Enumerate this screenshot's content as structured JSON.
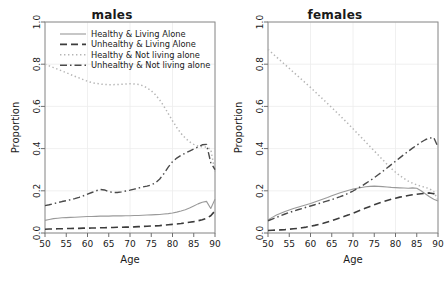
{
  "figure": {
    "background": "#ffffff",
    "axis_label_x": "Age",
    "axis_label_y": "Proportion"
  },
  "legend": {
    "items": [
      {
        "label": "Healthy & Living Alone",
        "style": "solid",
        "color": "#9a9a9a"
      },
      {
        "label": "Unhealthy & Living Alone",
        "style": "dashed",
        "color": "#3c3c3c"
      },
      {
        "label": "Healthy & Not living alone",
        "style": "dotted",
        "color": "#b5b5b5"
      },
      {
        "label": "Unhealthy & Not living alone",
        "style": "dashdot",
        "color": "#4a4a4a"
      }
    ]
  },
  "chart_data": [
    {
      "type": "line",
      "title": "males",
      "xlabel": "Age",
      "ylabel": "Proportion",
      "xlim": [
        50,
        90
      ],
      "ylim": [
        0.0,
        1.0
      ],
      "xticks": [
        50,
        55,
        60,
        65,
        70,
        75,
        80,
        85,
        90
      ],
      "yticks": [
        0.0,
        0.2,
        0.4,
        0.6,
        0.8,
        1.0
      ],
      "grid": true,
      "legend_position": "top-left-inside",
      "x": [
        50,
        51,
        52,
        53,
        54,
        55,
        56,
        57,
        58,
        59,
        60,
        61,
        62,
        63,
        64,
        65,
        66,
        67,
        68,
        69,
        70,
        71,
        72,
        73,
        74,
        75,
        76,
        77,
        78,
        79,
        80,
        81,
        82,
        83,
        84,
        85,
        86,
        87,
        88,
        89,
        90
      ],
      "series": [
        {
          "name": "Healthy & Living Alone",
          "style": "solid",
          "color": "#9a9a9a",
          "values": [
            0.06,
            0.064,
            0.068,
            0.07,
            0.072,
            0.073,
            0.074,
            0.075,
            0.076,
            0.077,
            0.078,
            0.078,
            0.079,
            0.08,
            0.08,
            0.08,
            0.081,
            0.081,
            0.081,
            0.082,
            0.082,
            0.083,
            0.083,
            0.084,
            0.085,
            0.086,
            0.087,
            0.088,
            0.09,
            0.092,
            0.095,
            0.099,
            0.104,
            0.11,
            0.118,
            0.128,
            0.138,
            0.146,
            0.15,
            0.116,
            0.16
          ]
        },
        {
          "name": "Unhealthy & Living Alone",
          "style": "dashed",
          "color": "#3c3c3c",
          "values": [
            0.018,
            0.019,
            0.019,
            0.02,
            0.02,
            0.021,
            0.021,
            0.022,
            0.022,
            0.023,
            0.023,
            0.024,
            0.024,
            0.025,
            0.025,
            0.026,
            0.026,
            0.027,
            0.027,
            0.028,
            0.028,
            0.029,
            0.03,
            0.031,
            0.032,
            0.033,
            0.034,
            0.035,
            0.037,
            0.039,
            0.041,
            0.043,
            0.045,
            0.048,
            0.051,
            0.054,
            0.058,
            0.063,
            0.07,
            0.082,
            0.105
          ]
        },
        {
          "name": "Healthy & Not living alone",
          "style": "dotted",
          "color": "#b5b5b5",
          "values": [
            0.8,
            0.792,
            0.784,
            0.776,
            0.768,
            0.76,
            0.751,
            0.743,
            0.735,
            0.727,
            0.719,
            0.713,
            0.709,
            0.706,
            0.704,
            0.703,
            0.703,
            0.704,
            0.705,
            0.706,
            0.707,
            0.706,
            0.704,
            0.698,
            0.688,
            0.674,
            0.655,
            0.63,
            0.6,
            0.566,
            0.532,
            0.5,
            0.472,
            0.45,
            0.432,
            0.42,
            0.412,
            0.408,
            0.408,
            0.396,
            0.29
          ]
        },
        {
          "name": "Unhealthy & Not living alone",
          "style": "dashdot",
          "color": "#4a4a4a",
          "values": [
            0.13,
            0.134,
            0.139,
            0.144,
            0.149,
            0.153,
            0.158,
            0.163,
            0.169,
            0.176,
            0.184,
            0.192,
            0.2,
            0.206,
            0.204,
            0.196,
            0.192,
            0.192,
            0.195,
            0.199,
            0.203,
            0.208,
            0.213,
            0.218,
            0.222,
            0.228,
            0.238,
            0.256,
            0.282,
            0.312,
            0.338,
            0.355,
            0.368,
            0.378,
            0.388,
            0.398,
            0.408,
            0.418,
            0.42,
            0.334,
            0.3
          ]
        }
      ]
    },
    {
      "type": "line",
      "title": "females",
      "xlabel": "Age",
      "ylabel": "Proportion",
      "xlim": [
        50,
        90
      ],
      "ylim": [
        0.0,
        1.0
      ],
      "xticks": [
        50,
        55,
        60,
        65,
        70,
        75,
        80,
        85,
        90
      ],
      "yticks": [
        0.0,
        0.2,
        0.4,
        0.6,
        0.8,
        1.0
      ],
      "grid": true,
      "legend_position": "none",
      "x": [
        50,
        51,
        52,
        53,
        54,
        55,
        56,
        57,
        58,
        59,
        60,
        61,
        62,
        63,
        64,
        65,
        66,
        67,
        68,
        69,
        70,
        71,
        72,
        73,
        74,
        75,
        76,
        77,
        78,
        79,
        80,
        81,
        82,
        83,
        84,
        85,
        86,
        87,
        88,
        89,
        90
      ],
      "series": [
        {
          "name": "Healthy & Living Alone",
          "style": "solid",
          "color": "#9a9a9a",
          "values": [
            0.062,
            0.074,
            0.085,
            0.094,
            0.102,
            0.109,
            0.116,
            0.122,
            0.128,
            0.134,
            0.14,
            0.147,
            0.154,
            0.161,
            0.168,
            0.176,
            0.184,
            0.191,
            0.197,
            0.203,
            0.208,
            0.212,
            0.216,
            0.219,
            0.221,
            0.222,
            0.221,
            0.22,
            0.218,
            0.216,
            0.215,
            0.214,
            0.213,
            0.212,
            0.214,
            0.212,
            0.2,
            0.186,
            0.172,
            0.16,
            0.152
          ]
        },
        {
          "name": "Unhealthy & Living Alone",
          "style": "dashed",
          "color": "#3c3c3c",
          "values": [
            0.012,
            0.013,
            0.014,
            0.015,
            0.016,
            0.018,
            0.02,
            0.022,
            0.025,
            0.028,
            0.032,
            0.036,
            0.041,
            0.046,
            0.052,
            0.058,
            0.065,
            0.072,
            0.079,
            0.086,
            0.094,
            0.102,
            0.11,
            0.118,
            0.126,
            0.134,
            0.141,
            0.148,
            0.154,
            0.16,
            0.165,
            0.17,
            0.174,
            0.178,
            0.181,
            0.184,
            0.186,
            0.188,
            0.19,
            0.186,
            0.175
          ]
        },
        {
          "name": "Healthy & Not living alone",
          "style": "dotted",
          "color": "#b5b5b5",
          "values": [
            0.87,
            0.852,
            0.834,
            0.816,
            0.798,
            0.78,
            0.762,
            0.744,
            0.726,
            0.708,
            0.69,
            0.671,
            0.652,
            0.633,
            0.614,
            0.595,
            0.575,
            0.555,
            0.535,
            0.515,
            0.494,
            0.473,
            0.452,
            0.431,
            0.41,
            0.389,
            0.368,
            0.347,
            0.326,
            0.306,
            0.288,
            0.272,
            0.258,
            0.246,
            0.236,
            0.228,
            0.222,
            0.216,
            0.21,
            0.196,
            0.155
          ]
        },
        {
          "name": "Unhealthy & Not living alone",
          "style": "dashdot",
          "color": "#4a4a4a",
          "values": [
            0.058,
            0.066,
            0.074,
            0.082,
            0.09,
            0.097,
            0.104,
            0.11,
            0.116,
            0.122,
            0.128,
            0.134,
            0.14,
            0.146,
            0.152,
            0.158,
            0.165,
            0.172,
            0.18,
            0.189,
            0.199,
            0.21,
            0.222,
            0.235,
            0.248,
            0.262,
            0.277,
            0.292,
            0.308,
            0.324,
            0.34,
            0.356,
            0.372,
            0.387,
            0.402,
            0.416,
            0.43,
            0.442,
            0.45,
            0.452,
            0.408
          ]
        }
      ]
    }
  ]
}
